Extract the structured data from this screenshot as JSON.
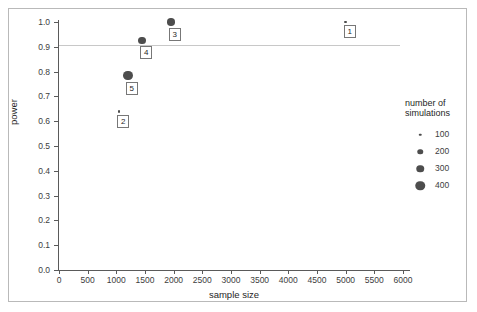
{
  "chart_data": {
    "type": "scatter",
    "title": "",
    "xlabel": "sample size",
    "ylabel": "power",
    "xlim": [
      0,
      6000
    ],
    "ylim": [
      0.0,
      1.0
    ],
    "grid": false,
    "legend_position": "right",
    "xticks": [
      0,
      500,
      1000,
      1500,
      2000,
      2500,
      3000,
      3500,
      4000,
      4500,
      5000,
      5500,
      6000
    ],
    "yticks": [
      "0.0",
      "0.1",
      "0.2",
      "0.3",
      "0.4",
      "0.5",
      "0.6",
      "0.7",
      "0.8",
      "0.9",
      "1.0"
    ],
    "reference_line": {
      "y": 0.9,
      "color": "#c8c8c8",
      "style": "solid"
    },
    "size_legend": {
      "title_line1": "number of",
      "title_line2": "simulations",
      "entries": [
        {
          "label": "100",
          "value": 100,
          "px": 2.5
        },
        {
          "label": "200",
          "value": 200,
          "px": 5.5
        },
        {
          "label": "300",
          "value": 300,
          "px": 7.5
        },
        {
          "label": "400",
          "value": 400,
          "px": 9.5
        }
      ]
    },
    "points": [
      {
        "label": "1",
        "x": 5000,
        "y": 1.0,
        "simulations": 100,
        "px": 2.5
      },
      {
        "label": "2",
        "x": 1050,
        "y": 0.64,
        "simulations": 100,
        "px": 2.5
      },
      {
        "label": "3",
        "x": 1950,
        "y": 1.0,
        "simulations": 300,
        "px": 7.5
      },
      {
        "label": "4",
        "x": 1450,
        "y": 0.925,
        "simulations": 300,
        "px": 7.5
      },
      {
        "label": "5",
        "x": 1200,
        "y": 0.785,
        "simulations": 400,
        "px": 9.5
      }
    ],
    "marker_color": "#4d4d4d"
  }
}
